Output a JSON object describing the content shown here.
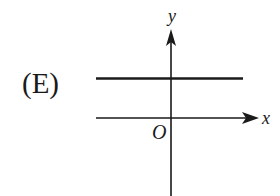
{
  "figure": {
    "option_label": "(E)",
    "axes": {
      "x_label": "x",
      "y_label": "y",
      "origin_label": "O"
    },
    "graph": {
      "description": "Horizontal line above the x-axis (constant positive y value)",
      "type": "horizontal-line",
      "relative_position": "above x-axis"
    },
    "colors": {
      "ink": "#1a1a1a",
      "background": "#ffffff"
    }
  }
}
